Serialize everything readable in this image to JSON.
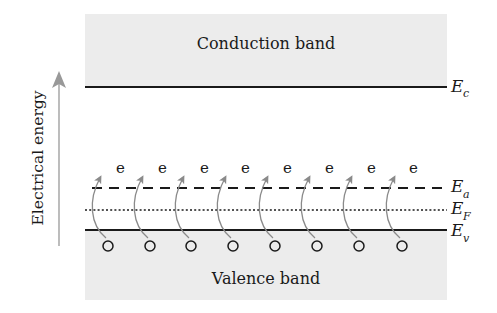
{
  "diagram": {
    "axis": {
      "label": "Electrical energy",
      "direction": "up",
      "color": "#999999"
    },
    "bands": {
      "conduction": {
        "label": "Conduction band",
        "fill": "#ececec"
      },
      "valence": {
        "label": "Valence band",
        "fill": "#ececec"
      }
    },
    "levels": [
      {
        "id": "Ec",
        "symbol": "E",
        "subscript": "c",
        "style": "solid"
      },
      {
        "id": "Ea",
        "symbol": "E",
        "subscript": "a",
        "style": "dashed"
      },
      {
        "id": "EF",
        "symbol": "E",
        "subscript": "F",
        "style": "dotted"
      },
      {
        "id": "Ev",
        "symbol": "E",
        "subscript": "v",
        "style": "solid"
      }
    ],
    "electrons": {
      "symbol": "e",
      "count": 8
    },
    "holes": {
      "symbol": "o",
      "count": 8
    },
    "transition_arrow_color": "#8a8a8a",
    "line_color": "#1a1a1a"
  }
}
